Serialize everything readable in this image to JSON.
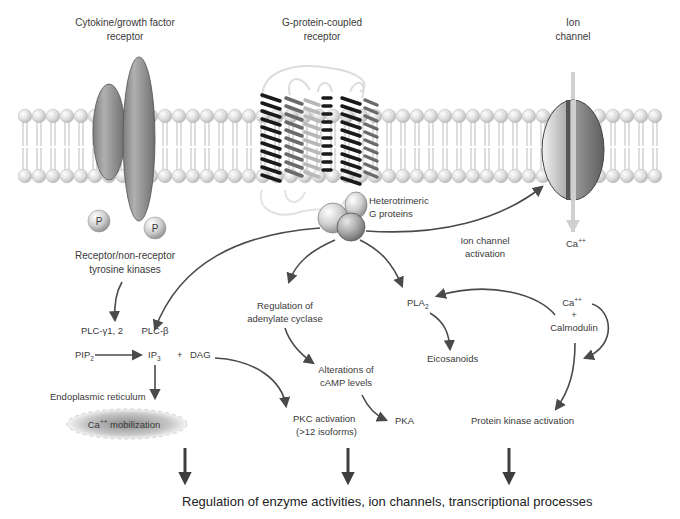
{
  "diagram": {
    "type": "signal-transduction-pathways",
    "colors": {
      "membrane_head": "#d9d9d9",
      "membrane_tail": "#cfcfcf",
      "receptor_fill": "#8a8a8a",
      "arrow": "#4a4a4a",
      "text": "#3a3a3a",
      "er_fill": "#9a9a9a"
    },
    "receptors": {
      "cytokine": {
        "line1": "Cytokine/growth factor",
        "line2": "receptor"
      },
      "gpcr": {
        "line1": "G-protein-coupled",
        "line2": "receptor"
      },
      "ion_channel": {
        "line1": "Ion",
        "line2": "channel"
      }
    },
    "phospho_label": "P",
    "tyrosine_kinases": {
      "line1": "Receptor/non-receptor",
      "line2": "tyrosine kinases"
    },
    "g_proteins": {
      "line1": "Heterotrimeric",
      "line2": "G proteins"
    },
    "ion_channel_activation": {
      "line1": "Ion channel",
      "line2": "activation"
    },
    "ca_influx": {
      "base": "Ca",
      "sup": "++"
    },
    "plc_gamma": "PLC-γ1, 2",
    "plc_beta": "PLC-β",
    "pip2": {
      "base": "PIP",
      "sub": "2"
    },
    "ip3": {
      "base": "IP",
      "sub": "3"
    },
    "plus": "+",
    "dag": "DAG",
    "er_label": "Endoplasmic reticulum",
    "ca_mobilization": {
      "base": "Ca",
      "sup": "++",
      "rest": " mobilization"
    },
    "adenylate": {
      "line1": "Regulation of",
      "line2": "adenylate cyclase"
    },
    "camp": {
      "line1": "Alterations of",
      "line2": "cAMP levels"
    },
    "pkc": {
      "line1": "PKC activation",
      "line2": "(>12 isoforms)"
    },
    "pka": "PKA",
    "pla2": {
      "base": "PLA",
      "sub": "2"
    },
    "eicosanoids": "Eicosanoids",
    "calmodulin": {
      "ca_base": "Ca",
      "ca_sup": "++",
      "plus": "+",
      "name": "Calmodulin"
    },
    "protein_kinase": "Protein kinase activation",
    "bottom_label": "Regulation of enzyme activities, ion channels, transcriptional processes"
  }
}
